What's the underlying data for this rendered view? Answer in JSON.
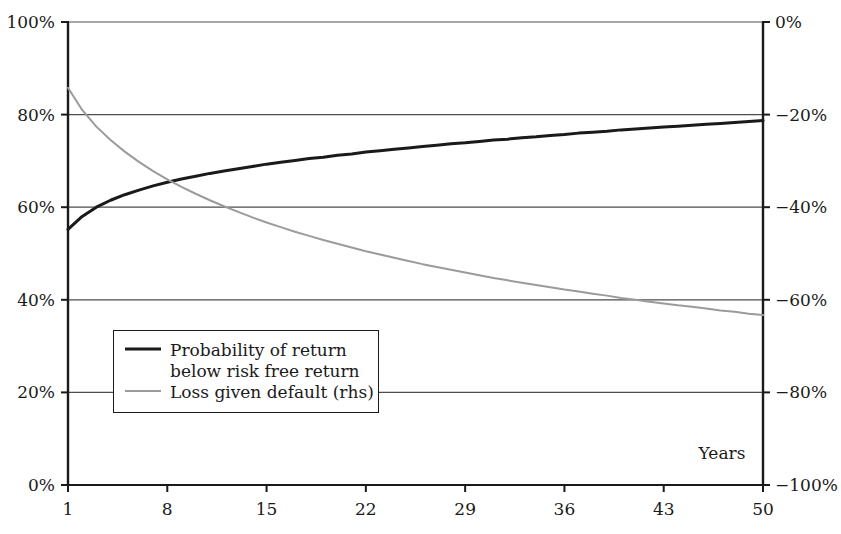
{
  "chart_data": {
    "type": "line",
    "title": "",
    "xlabel": "Years",
    "ylabel": "",
    "y2label": "",
    "grid": true,
    "legend_position": "inside-lower-left",
    "x": [
      1,
      2,
      3,
      4,
      5,
      6,
      7,
      8,
      9,
      10,
      11,
      12,
      13,
      14,
      15,
      16,
      17,
      18,
      19,
      20,
      21,
      22,
      23,
      24,
      25,
      26,
      27,
      28,
      29,
      30,
      31,
      32,
      33,
      34,
      35,
      36,
      37,
      38,
      39,
      40,
      41,
      42,
      43,
      44,
      45,
      46,
      47,
      48,
      49,
      50
    ],
    "xlim": [
      1,
      50
    ],
    "xticks": [
      1,
      8,
      15,
      22,
      29,
      36,
      43,
      50
    ],
    "xticklabels": [
      "1",
      "8",
      "15",
      "22",
      "29",
      "36",
      "43",
      "50"
    ],
    "ylim": [
      0,
      100
    ],
    "yticks": [
      0,
      20,
      40,
      60,
      80,
      100
    ],
    "yticklabels": [
      "0%",
      "20%",
      "40%",
      "60%",
      "80%",
      "100%"
    ],
    "y2lim": [
      -100,
      0
    ],
    "y2ticks": [
      -100,
      -80,
      -60,
      -40,
      -20,
      0
    ],
    "y2ticklabels": [
      "−100%",
      "−80%",
      "−60%",
      "−40%",
      "−20%",
      "0%"
    ],
    "series": [
      {
        "name": "Probability of return below risk free return",
        "axis": "left",
        "color": "#1a1a1a",
        "width": 3,
        "unit": "%",
        "values": [
          55.2,
          58.0,
          60.0,
          61.5,
          62.7,
          63.7,
          64.6,
          65.4,
          66.1,
          66.7,
          67.3,
          67.8,
          68.3,
          68.8,
          69.3,
          69.7,
          70.1,
          70.5,
          70.8,
          71.2,
          71.5,
          71.9,
          72.2,
          72.5,
          72.8,
          73.1,
          73.4,
          73.7,
          73.9,
          74.2,
          74.5,
          74.7,
          75.0,
          75.2,
          75.5,
          75.7,
          76.0,
          76.2,
          76.4,
          76.7,
          76.9,
          77.1,
          77.3,
          77.5,
          77.7,
          77.9,
          78.1,
          78.3,
          78.5,
          78.7
        ]
      },
      {
        "name": "Loss given default (rhs)",
        "axis": "right",
        "color": "#9b9b9b",
        "width": 2,
        "unit": "%",
        "values": [
          -14.2,
          -19.0,
          -22.6,
          -25.5,
          -28.0,
          -30.2,
          -32.2,
          -34.0,
          -35.6,
          -37.1,
          -38.5,
          -39.8,
          -41.0,
          -42.2,
          -43.3,
          -44.3,
          -45.3,
          -46.2,
          -47.1,
          -47.9,
          -48.7,
          -49.5,
          -50.2,
          -50.9,
          -51.6,
          -52.3,
          -52.9,
          -53.5,
          -54.1,
          -54.7,
          -55.3,
          -55.8,
          -56.3,
          -56.8,
          -57.3,
          -57.8,
          -58.2,
          -58.7,
          -59.1,
          -59.6,
          -60.0,
          -60.4,
          -60.8,
          -61.2,
          -61.5,
          -61.9,
          -62.3,
          -62.6,
          -63.0,
          -63.3
        ]
      }
    ]
  },
  "legend": {
    "entries": [
      {
        "label": "Probability of return below risk free return",
        "swatch": "solid-black-line"
      },
      {
        "label": "Loss given default (rhs)",
        "swatch": "solid-gray-line"
      }
    ]
  },
  "axis": {
    "x_title": "Years"
  },
  "colors": {
    "series_primary": "#1a1a1a",
    "series_secondary": "#9b9b9b",
    "axis": "#1a1a1a",
    "grid": "#4d4d4d",
    "background": "#ffffff"
  }
}
